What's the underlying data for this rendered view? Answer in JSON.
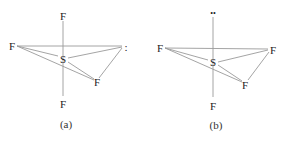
{
  "figure": {
    "panels": [
      {
        "caption": "(a)",
        "central_atom": "S",
        "axial_top": "F",
        "axial_bottom": "F",
        "equatorial_left": "F",
        "equatorial_right": ":",
        "equatorial_front": "F"
      },
      {
        "caption": "(b)",
        "central_atom": "S",
        "axial_top": "••",
        "axial_bottom": "F",
        "equatorial_left": "F",
        "equatorial_right": "F",
        "equatorial_front": "F"
      }
    ]
  }
}
